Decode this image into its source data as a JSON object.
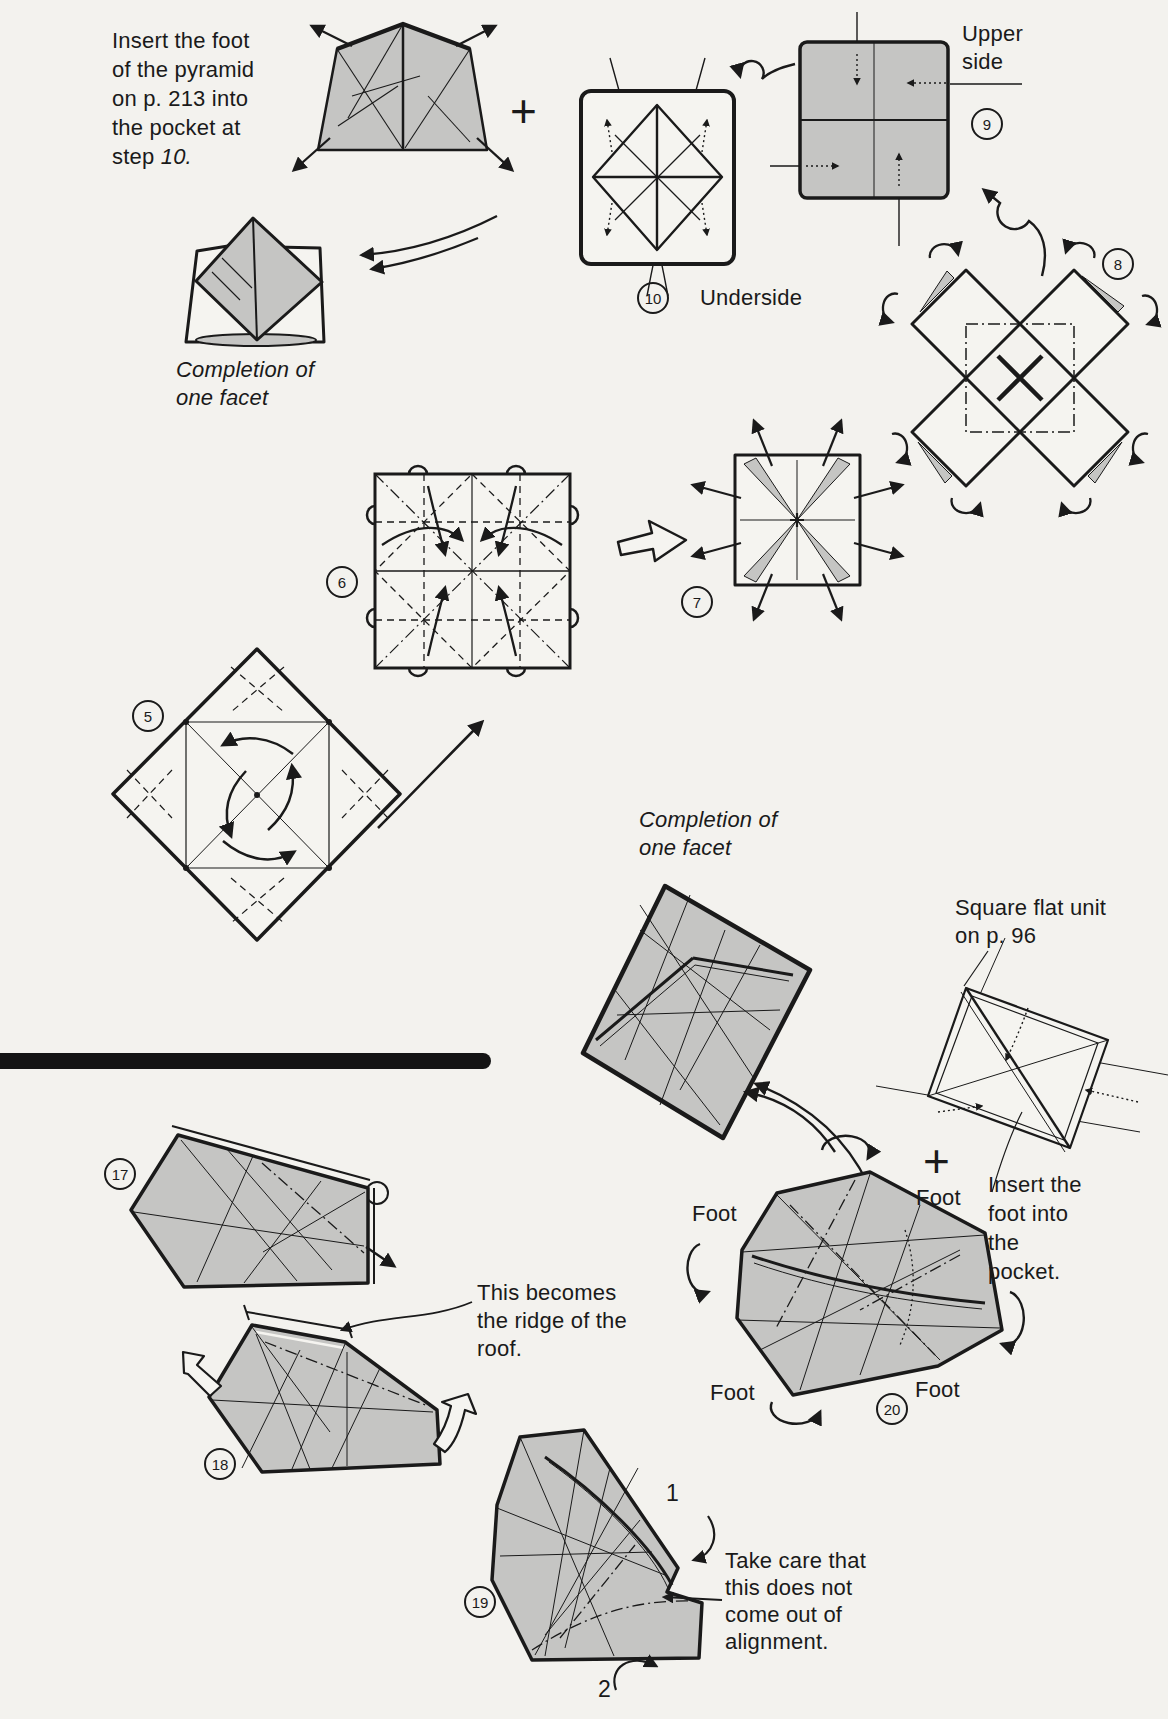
{
  "colors": {
    "paper": "#f3f2ee",
    "ink": "#1a1a1a",
    "shape_white": "#f5f4f0",
    "shape_gray": "#c5c5c3"
  },
  "texts": {
    "note_insert_pyramid": {
      "lines": [
        "Insert the foot",
        "of the pyramid",
        "on p. 213 into",
        "the pocket at"
      ],
      "tail_word": "step",
      "tail_ref": "10."
    },
    "completion_caption": {
      "lines": [
        "Completion of",
        "one facet"
      ]
    },
    "upper_side": {
      "lines": [
        "Upper",
        "side"
      ]
    },
    "underside": "Underside",
    "square_flat_unit": {
      "lines": [
        "Square flat unit",
        "on p. 96"
      ]
    },
    "insert_foot": {
      "lines": [
        "Insert the",
        "foot into",
        "the",
        "pocket."
      ]
    },
    "ridge_note": {
      "lines": [
        "This becomes",
        "the ridge of the",
        "roof."
      ]
    },
    "alignment_note": {
      "lines": [
        "Take care that",
        "this does not",
        "come out of",
        "alignment."
      ]
    },
    "foot": "Foot",
    "plus": "+",
    "flap_1": "1",
    "flap_2": "2"
  },
  "steps": {
    "s5": "5",
    "s6": "6",
    "s7": "7",
    "s8": "8",
    "s9": "9",
    "s10": "10",
    "s17": "17",
    "s18": "18",
    "s19": "19",
    "s20": "20"
  }
}
